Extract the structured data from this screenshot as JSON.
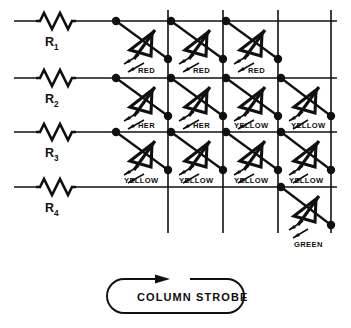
{
  "figure": {
    "rows": [
      {
        "id": "row-1",
        "resistor_label": "R",
        "resistor_subscript": "1",
        "y": 21
      },
      {
        "id": "row-2",
        "resistor_label": "R",
        "resistor_subscript": "2",
        "y": 78
      },
      {
        "id": "row-3",
        "resistor_label": "R",
        "resistor_subscript": "3",
        "y": 132
      },
      {
        "id": "row-4",
        "resistor_label": "R",
        "resistor_subscript": "4",
        "y": 187
      }
    ],
    "columns": [
      {
        "id": "col-1",
        "x": 168
      },
      {
        "id": "col-2",
        "x": 223
      },
      {
        "id": "col-3",
        "x": 278
      },
      {
        "id": "col-4",
        "x": 331
      }
    ],
    "leds": [
      {
        "row": 1,
        "column": 1,
        "label": "RED",
        "anode_x": 116,
        "anode_y": 21,
        "cathode_x": 168,
        "cathode_y": 59
      },
      {
        "row": 1,
        "column": 2,
        "label": "RED",
        "anode_x": 171,
        "anode_y": 21,
        "cathode_x": 223,
        "cathode_y": 59
      },
      {
        "row": 1,
        "column": 3,
        "label": "RED",
        "anode_x": 226,
        "anode_y": 21,
        "cathode_x": 278,
        "cathode_y": 59
      },
      {
        "row": 2,
        "column": 1,
        "label": "HER",
        "anode_x": 116,
        "anode_y": 78,
        "cathode_x": 168,
        "cathode_y": 116
      },
      {
        "row": 2,
        "column": 2,
        "label": "HER",
        "anode_x": 171,
        "anode_y": 78,
        "cathode_x": 223,
        "cathode_y": 116
      },
      {
        "row": 2,
        "column": 3,
        "label": "YELLOW",
        "anode_x": 226,
        "anode_y": 78,
        "cathode_x": 278,
        "cathode_y": 116
      },
      {
        "row": 2,
        "column": 4,
        "label": "YELLOW",
        "anode_x": 281,
        "anode_y": 78,
        "cathode_x": 331,
        "cathode_y": 116
      },
      {
        "row": 3,
        "column": 1,
        "label": "YELLOW",
        "anode_x": 116,
        "anode_y": 132,
        "cathode_x": 168,
        "cathode_y": 170
      },
      {
        "row": 3,
        "column": 2,
        "label": "YELLOW",
        "anode_x": 171,
        "anode_y": 132,
        "cathode_x": 223,
        "cathode_y": 170
      },
      {
        "row": 3,
        "column": 3,
        "label": "YELLOW",
        "anode_x": 226,
        "anode_y": 132,
        "cathode_x": 278,
        "cathode_y": 170
      },
      {
        "row": 3,
        "column": 4,
        "label": "YELLOW",
        "anode_x": 281,
        "anode_y": 132,
        "cathode_x": 331,
        "cathode_y": 170
      },
      {
        "row": 4,
        "column": 4,
        "label": "GREEN",
        "anode_x": 281,
        "anode_y": 187,
        "cathode_x": 331,
        "cathode_y": 225
      }
    ],
    "strobe": {
      "label": "COLUMN STROBE",
      "arrow_direction": "right"
    },
    "colors": {
      "ink": "#101010",
      "background": "#ffffff"
    }
  }
}
